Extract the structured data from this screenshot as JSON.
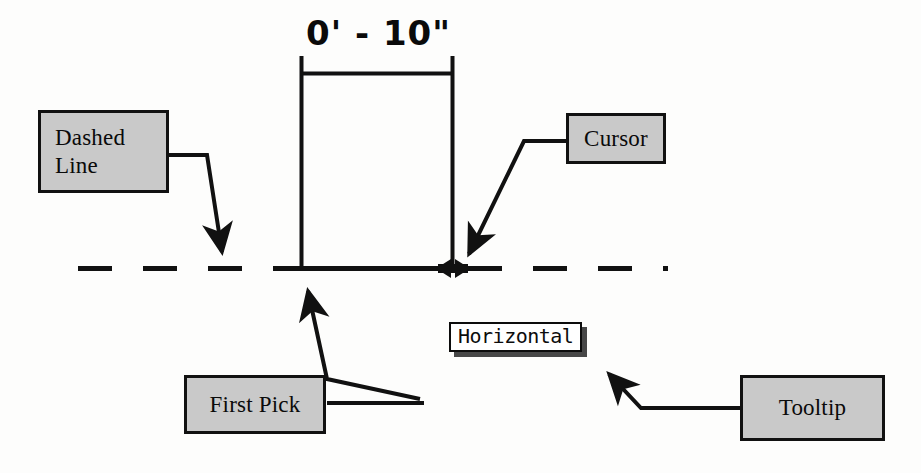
{
  "diagram": {
    "background_color": "#fdfdfc",
    "ink_color": "#111111",
    "callout_fill_color": "#c9c9c9"
  },
  "dimension": {
    "value_label": "0' - 10\"",
    "feet": 0,
    "inches": 10
  },
  "tooltip": {
    "text": "Horizontal"
  },
  "callouts": [
    {
      "id": "dashed-line",
      "label": "Dashed\nLine",
      "points_to": "dashed-reference-line"
    },
    {
      "id": "cursor",
      "label": "Cursor",
      "points_to": "cursor-resize-arrow"
    },
    {
      "id": "first-pick",
      "label": "First Pick",
      "points_to": "first-pick-point"
    },
    {
      "id": "tooltip",
      "label": "Tooltip",
      "points_to": "tooltip-horizontal"
    }
  ],
  "elements": {
    "dashed_line_name": "dashed-reference-line",
    "cursor_name": "cursor-resize-arrow",
    "dimension_line_name": "dimension-line",
    "extension_line_left_name": "extension-line-left",
    "extension_line_right_name": "extension-line-right"
  }
}
